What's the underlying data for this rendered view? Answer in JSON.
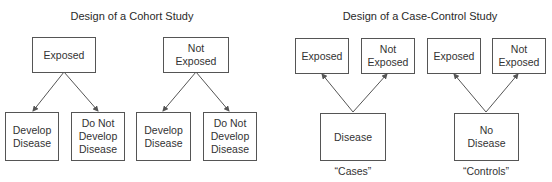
{
  "cohort": {
    "title": "Design of a Cohort Study",
    "top_boxes": [
      {
        "label": "Exposed"
      },
      {
        "label": "Not\nExposed"
      }
    ],
    "bottom_boxes": [
      {
        "label": "Develop\nDisease"
      },
      {
        "label": "Do Not\nDevelop\nDisease"
      },
      {
        "label": "Develop\nDisease"
      },
      {
        "label": "Do Not\nDevelop\nDisease"
      }
    ],
    "arrow_direction": "top-to-bottom"
  },
  "case_control": {
    "title": "Design of a Case-Control Study",
    "top_boxes": [
      {
        "label": "Exposed"
      },
      {
        "label": "Not\nExposed"
      },
      {
        "label": "Exposed"
      },
      {
        "label": "Not\nExposed"
      }
    ],
    "bottom_boxes": [
      {
        "label": "Disease",
        "caption": "“Cases”"
      },
      {
        "label": "No\nDisease",
        "caption": "“Controls”"
      }
    ],
    "arrow_direction": "bottom-to-top"
  },
  "colors": {
    "line": "#555555",
    "text": "#333333",
    "background": "#ffffff"
  }
}
